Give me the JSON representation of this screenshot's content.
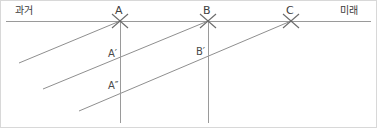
{
  "diagram": {
    "kind": "timeline-projection-diagram",
    "background_color": "#ffffff",
    "border_color": "#d8d8d8",
    "line_color": "#9a9a9a",
    "marker_color": "#6b6b6b",
    "text_color": "#3f3f3f",
    "axis": {
      "left_label": "과거",
      "right_label": "미래",
      "left_label_x": 14,
      "left_label_y": 4,
      "right_label_x": 339,
      "right_label_y": 4,
      "y": 20,
      "x_start": 5,
      "x_end": 370
    },
    "timeline_points": [
      {
        "label": "A",
        "x": 119,
        "y": 20,
        "label_x": 114,
        "label_y": 4,
        "marker": "x-marker"
      },
      {
        "label": "B",
        "x": 207,
        "y": 20,
        "label_x": 202,
        "label_y": 4,
        "marker": "x-marker"
      },
      {
        "label": "C",
        "x": 290,
        "y": 20,
        "label_x": 285,
        "label_y": 4,
        "marker": "x-marker"
      }
    ],
    "vertical_lines": [
      {
        "name": "vertical-through-a",
        "x": 119,
        "y_top": 20,
        "y_bottom": 122
      },
      {
        "name": "vertical-through-b",
        "x": 207,
        "y_top": 20,
        "y_bottom": 122
      }
    ],
    "diagonal_lines": [
      {
        "name": "diagonal-to-a",
        "x1": 18,
        "y1": 62,
        "x2": 119,
        "y2": 20
      },
      {
        "name": "diagonal-to-b",
        "x1": 42,
        "y1": 88,
        "x2": 207,
        "y2": 20
      },
      {
        "name": "diagonal-to-c",
        "x1": 78,
        "y1": 110,
        "x2": 290,
        "y2": 20
      }
    ],
    "intersection_labels": [
      {
        "label": "A′",
        "label_x": 107,
        "label_y": 47
      },
      {
        "label": "B′",
        "label_x": 195,
        "label_y": 45
      },
      {
        "label": "A″",
        "label_x": 107,
        "label_y": 79
      }
    ]
  }
}
